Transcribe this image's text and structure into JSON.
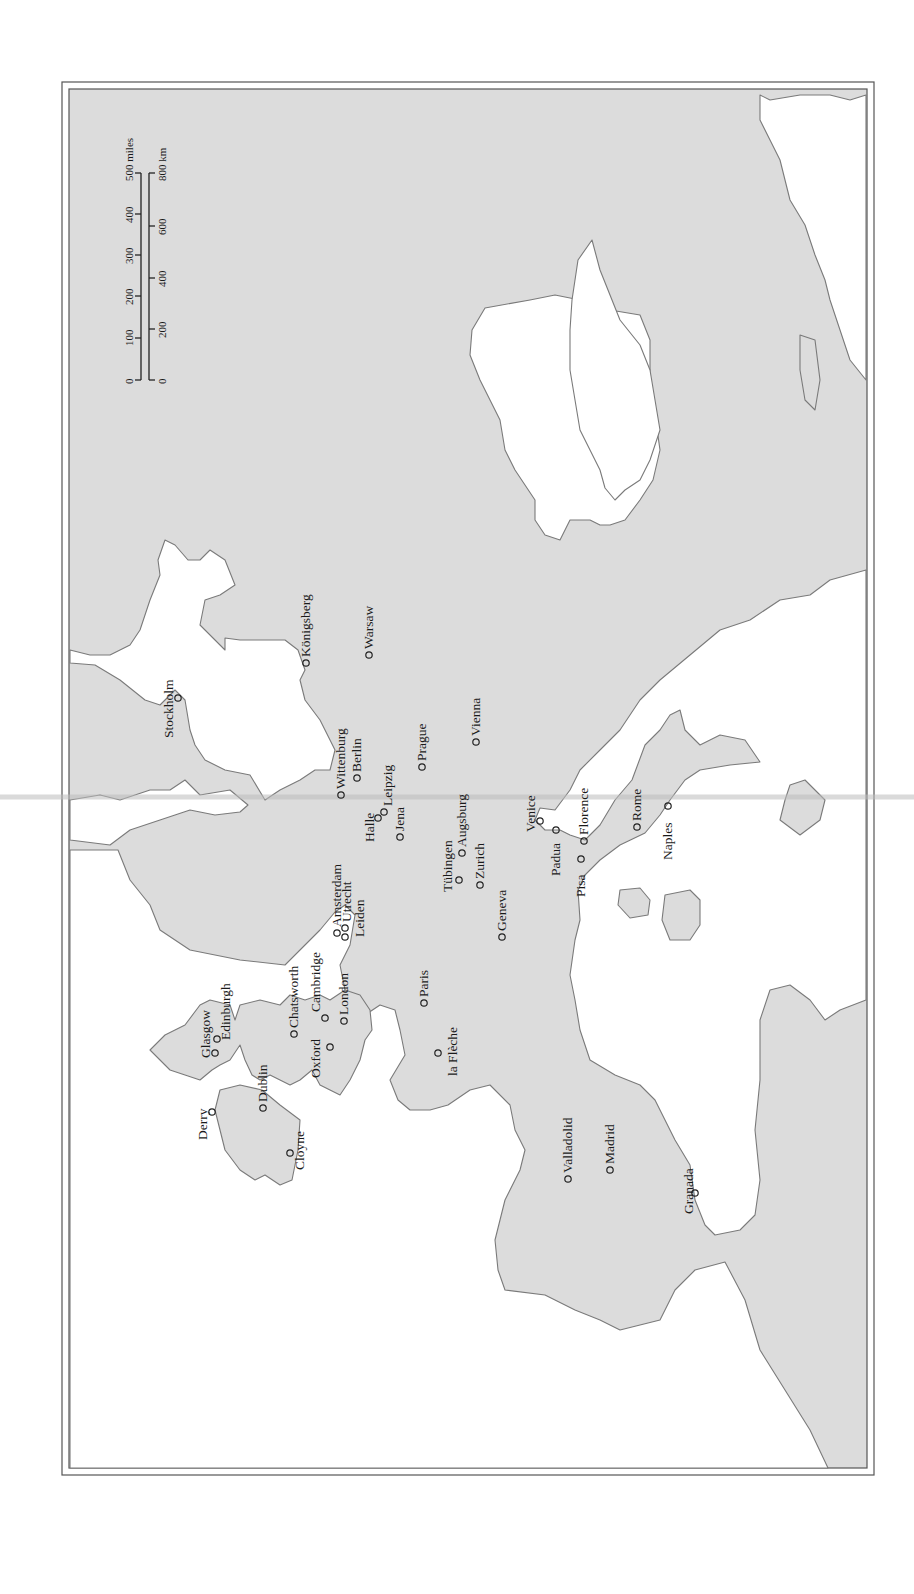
{
  "map": {
    "orientation": "rotated 90 degrees counter-clockwise (north points left)",
    "colors": {
      "land": "#dcdcdc",
      "sea": "#ffffff",
      "coast": "#7a7a7a",
      "text": "#1a1a1a",
      "frame": "#555555"
    },
    "scale_bar": {
      "miles": {
        "unit_label": "500 miles",
        "ticks": [
          "0",
          "100",
          "200",
          "300",
          "400"
        ]
      },
      "km": {
        "unit_label": "800 km",
        "ticks": [
          "0",
          "200",
          "400",
          "600"
        ]
      }
    },
    "cities": [
      {
        "id": "stockholm",
        "label": "Stockholm",
        "x": 178,
        "y": 698
      },
      {
        "id": "konigsberg",
        "label": "Königsberg",
        "x": 306,
        "y": 663
      },
      {
        "id": "warsaw",
        "label": "Warsaw",
        "x": 369,
        "y": 655
      },
      {
        "id": "wittenburg",
        "label": "Wittenburg",
        "x": 341,
        "y": 795
      },
      {
        "id": "berlin",
        "label": "Berlin",
        "x": 357,
        "y": 778
      },
      {
        "id": "halle",
        "label": "Halle",
        "x": 378,
        "y": 818
      },
      {
        "id": "leipzig",
        "label": "Leipzig",
        "x": 384,
        "y": 814
      },
      {
        "id": "jena",
        "label": "Jena",
        "x": 400,
        "y": 837
      },
      {
        "id": "prague",
        "label": "Prague",
        "x": 422,
        "y": 767
      },
      {
        "id": "vienna",
        "label": "Vienna",
        "x": 476,
        "y": 742
      },
      {
        "id": "amsterdam",
        "label": "Amsterdam",
        "x": 337,
        "y": 933
      },
      {
        "id": "utrecht",
        "label": "Utrecht",
        "x": 345,
        "y": 928
      },
      {
        "id": "leiden",
        "label": "Leiden",
        "x": 351,
        "y": 935
      },
      {
        "id": "tubingen",
        "label": "Tübingen",
        "x": 459,
        "y": 880
      },
      {
        "id": "augsburg",
        "label": "Augsburg",
        "x": 462,
        "y": 853
      },
      {
        "id": "zurich",
        "label": "Zurich",
        "x": 480,
        "y": 885
      },
      {
        "id": "geneva",
        "label": "Geneva",
        "x": 502,
        "y": 937
      },
      {
        "id": "venice",
        "label": "Venice",
        "x": 540,
        "y": 821
      },
      {
        "id": "padua",
        "label": "Padua",
        "x": 556,
        "y": 830
      },
      {
        "id": "pisa",
        "label": "Pisa",
        "x": 581,
        "y": 859
      },
      {
        "id": "florence",
        "label": "Florence",
        "x": 584,
        "y": 841
      },
      {
        "id": "rome",
        "label": "Rome",
        "x": 637,
        "y": 827
      },
      {
        "id": "naples",
        "label": "Naples",
        "x": 668,
        "y": 806
      },
      {
        "id": "edinburgh",
        "label": "Edinburgh",
        "x": 217,
        "y": 1039
      },
      {
        "id": "glasgow",
        "label": "Glasgow",
        "x": 215,
        "y": 1053
      },
      {
        "id": "chatsworth",
        "label": "Chatsworth",
        "x": 294,
        "y": 1034
      },
      {
        "id": "cambridge",
        "label": "Cambridge",
        "x": 325,
        "y": 1018
      },
      {
        "id": "oxford",
        "label": "Oxford",
        "x": 316,
        "y": 1047
      },
      {
        "id": "london",
        "label": "London",
        "x": 344,
        "y": 1021
      },
      {
        "id": "paris",
        "label": "Paris",
        "x": 424,
        "y": 1003
      },
      {
        "id": "la-fleche",
        "label": "la Flèche",
        "x": 436,
        "y": 1053
      },
      {
        "id": "dublin",
        "label": "Dublin",
        "x": 263,
        "y": 1108
      },
      {
        "id": "derry",
        "label": "Derry",
        "x": 212,
        "y": 1112
      },
      {
        "id": "cloyne",
        "label": "Cloyne",
        "x": 290,
        "y": 1153
      },
      {
        "id": "valladolid",
        "label": "Valladolid",
        "x": 568,
        "y": 1179
      },
      {
        "id": "madrid",
        "label": "Madrid",
        "x": 610,
        "y": 1170
      },
      {
        "id": "granada",
        "label": "Granada",
        "x": 695,
        "y": 1193
      }
    ]
  }
}
